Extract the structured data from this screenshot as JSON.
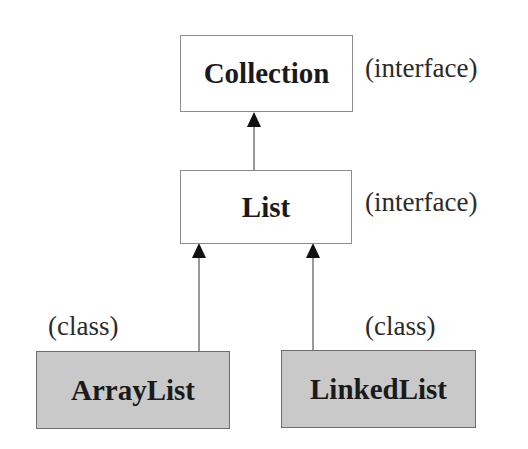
{
  "diagram": {
    "type": "class-hierarchy",
    "nodes": [
      {
        "id": "collection",
        "name": "Collection",
        "kind_label": "(interface)",
        "kind": "interface"
      },
      {
        "id": "list",
        "name": "List",
        "kind_label": "(interface)",
        "kind": "interface"
      },
      {
        "id": "arraylist",
        "name": "ArrayList",
        "kind_label": "(class)",
        "kind": "class"
      },
      {
        "id": "linkedlist",
        "name": "LinkedList",
        "kind_label": "(class)",
        "kind": "class"
      }
    ],
    "edges": [
      {
        "from": "list",
        "to": "collection",
        "style": "arrow"
      },
      {
        "from": "arraylist",
        "to": "list",
        "style": "arrow"
      },
      {
        "from": "linkedlist",
        "to": "list",
        "style": "arrow"
      }
    ],
    "colors": {
      "interface_fill": "#ffffff",
      "class_fill": "#c9c9c9",
      "border": "#8c8c8c",
      "line": "#555555",
      "arrowhead": "#111111"
    }
  }
}
